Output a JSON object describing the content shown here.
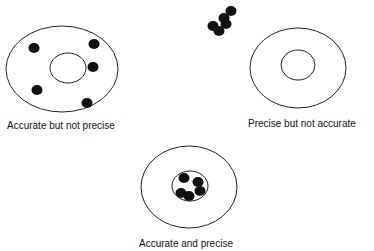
{
  "diagram": {
    "targets": [
      {
        "id": "accurate-not-precise",
        "label": "Accurate but not precise",
        "outer": {
          "cx": 62,
          "cy": 69,
          "rx": 56,
          "ry": 43
        },
        "inner": {
          "cx": 68,
          "cy": 68,
          "rx": 18,
          "ry": 15
        },
        "dots": [
          [
            34,
            48
          ],
          [
            94,
            44
          ],
          [
            93,
            67
          ],
          [
            37,
            90
          ],
          [
            87,
            103
          ]
        ]
      },
      {
        "id": "precise-not-accurate",
        "label": "Precise but not accurate",
        "outer": {
          "cx": 298,
          "cy": 68,
          "rx": 48,
          "ry": 40
        },
        "inner": {
          "cx": 298,
          "cy": 65,
          "rx": 17,
          "ry": 15
        },
        "dots": [
          [
            226,
            24
          ],
          [
            231,
            11
          ],
          [
            213,
            26
          ],
          [
            224,
            18
          ],
          [
            219,
            31
          ]
        ]
      },
      {
        "id": "accurate-and-precise",
        "label": "Accurate and precise",
        "outer": {
          "cx": 189,
          "cy": 187,
          "rx": 48,
          "ry": 41
        },
        "inner": {
          "cx": 190,
          "cy": 186,
          "rx": 18,
          "ry": 15
        },
        "dots": [
          [
            184,
            178
          ],
          [
            198,
            182
          ],
          [
            181,
            193
          ],
          [
            189,
            196
          ],
          [
            200,
            191
          ]
        ]
      }
    ],
    "dot_color": "#111111",
    "line_color": "#222222"
  }
}
